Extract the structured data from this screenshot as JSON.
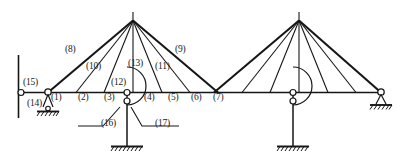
{
  "diagram": {
    "type": "structural-frame-truss",
    "stroke_color": "#161616",
    "background_color": "#ffffff",
    "members": {
      "1": "(1)",
      "2": "(2)",
      "3": "(3)",
      "4": "(4)",
      "5": "(5)",
      "6": "(6)",
      "7": "(7)",
      "8": "(8)",
      "9": "(9)",
      "10": "(10)",
      "11": "(11)",
      "12": "(12)",
      "13": "(13)",
      "14": "(14)",
      "15": "(15)",
      "16": "(16)",
      "17": "(17)"
    },
    "supports": {
      "left_wall_hinge": "pin-on-wall",
      "left_pin": "pin-support-hatched",
      "bottom_fixed": "fixed-support-hatched",
      "right_bottom_fixed": "fixed-support-hatched",
      "right_pin": "pin-support-hatched"
    },
    "geometry": {
      "chord_y": 92,
      "apex_left_x": 133,
      "apex_right_x": 299,
      "apex_y": 20,
      "left_end_x": 21,
      "right_end_x": 381
    }
  }
}
